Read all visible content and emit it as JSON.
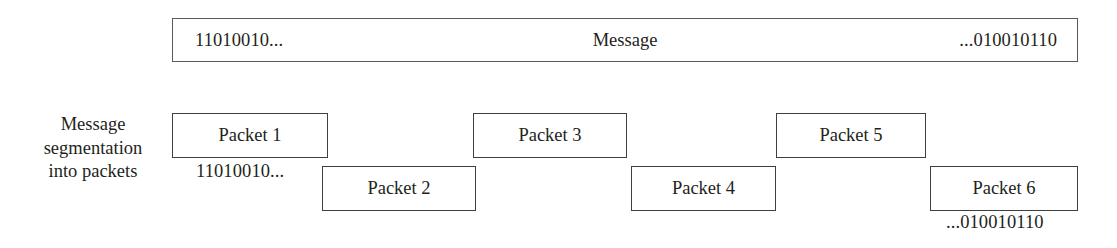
{
  "figure": {
    "title": "Message segmentation into packets",
    "background_color": "#ffffff",
    "text_color": "#231f20",
    "border_color": "#58595b"
  },
  "message_bar": {
    "left_bits": "11010010...",
    "center_label": "Message",
    "right_bits": "...010010110"
  },
  "caption": {
    "line1": "Message",
    "line2": "segmentation",
    "line3": "into packets"
  },
  "packets": [
    {
      "label": "Packet 1",
      "row": "top"
    },
    {
      "label": "Packet 2",
      "row": "bottom"
    },
    {
      "label": "Packet 3",
      "row": "top"
    },
    {
      "label": "Packet 4",
      "row": "bottom"
    },
    {
      "label": "Packet 5",
      "row": "top"
    },
    {
      "label": "Packet 6",
      "row": "bottom"
    }
  ],
  "annotations": {
    "first_packet_bits": "11010010...",
    "last_packet_bits": "...010010110"
  }
}
